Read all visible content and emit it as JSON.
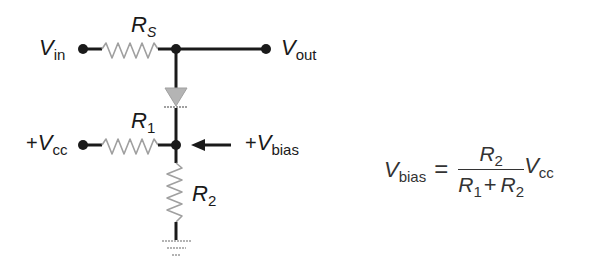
{
  "diagram": {
    "type": "circuit-schematic",
    "colors": {
      "wire": "#1a1a1a",
      "resistor": "#a0a0a0",
      "diode": "#a8a8a8",
      "ground": "#9a9a9a",
      "text": "#1a1a1a"
    },
    "labels": {
      "vin": {
        "main": "V",
        "sub": "in"
      },
      "vout": {
        "main": "V",
        "sub": "out"
      },
      "vcc": {
        "prefix": "+",
        "main": "V",
        "sub": "cc"
      },
      "vbias": {
        "prefix": "+",
        "main": "V",
        "sub": "bias"
      },
      "rs": {
        "main": "R",
        "sub": "S"
      },
      "r1": {
        "main": "R",
        "sub": "1"
      },
      "r2": {
        "main": "R",
        "sub": "2"
      }
    },
    "components": [
      {
        "id": "RS",
        "kind": "resistor",
        "orientation": "horizontal",
        "between": [
          "Vin",
          "node_top"
        ]
      },
      {
        "id": "D",
        "kind": "diode",
        "orientation": "vertical",
        "direction": "down",
        "between": [
          "node_top",
          "node_bias"
        ]
      },
      {
        "id": "R1",
        "kind": "resistor",
        "orientation": "horizontal",
        "between": [
          "+Vcc",
          "node_bias"
        ]
      },
      {
        "id": "R2",
        "kind": "resistor",
        "orientation": "vertical",
        "between": [
          "node_bias",
          "ground"
        ]
      },
      {
        "id": "GND",
        "kind": "ground"
      }
    ],
    "arrow": {
      "points_to": "node_bias",
      "label": "+Vbias"
    }
  },
  "equation": {
    "lhs": {
      "main": "V",
      "sub": "bias"
    },
    "equals": "=",
    "numerator": {
      "main": "R",
      "sub": "2"
    },
    "denominator": [
      {
        "main": "R",
        "sub": "1"
      },
      {
        "op": "+"
      },
      {
        "main": "R",
        "sub": "2"
      }
    ],
    "multiplier": {
      "main": "V",
      "sub": "cc"
    }
  }
}
